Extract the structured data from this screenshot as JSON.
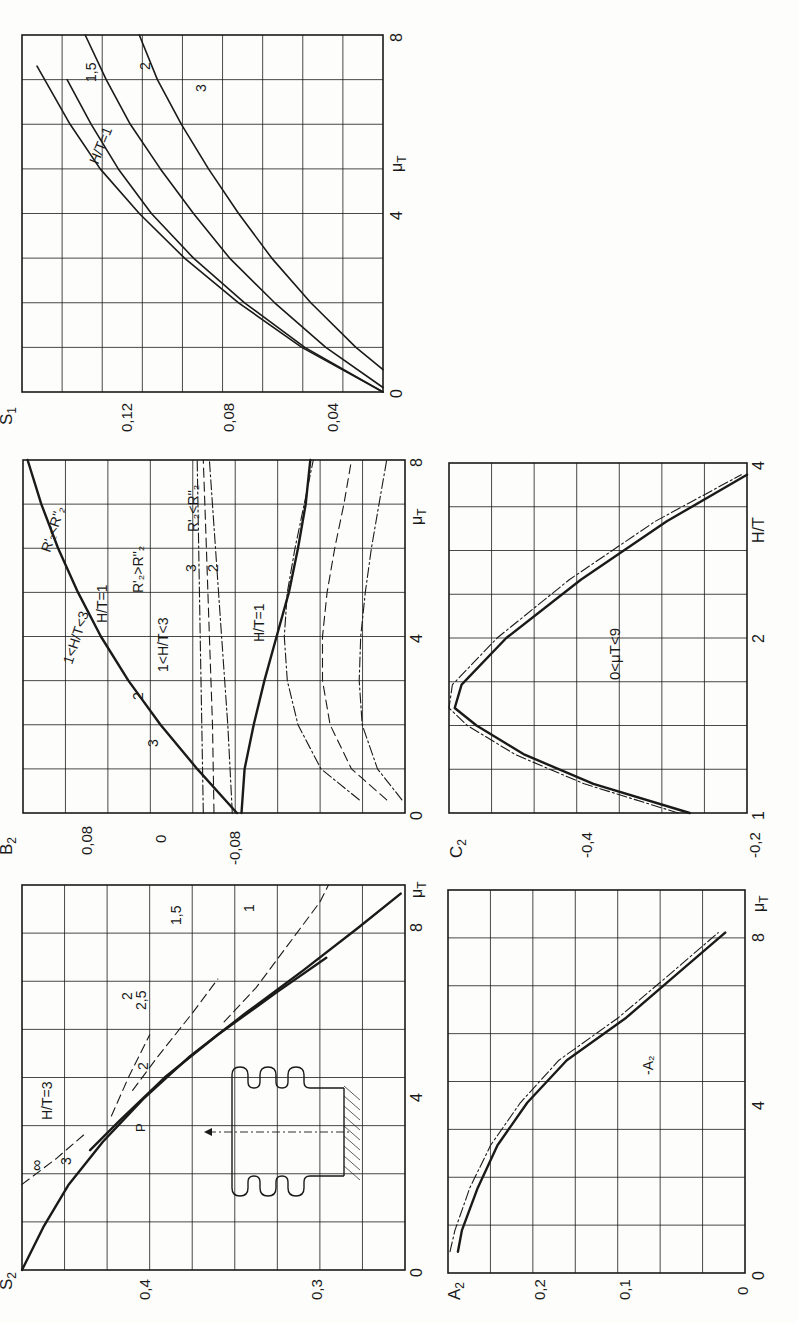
{
  "figure": {
    "orientation": "rotated 90° counter-clockwise",
    "background": "#fdfdfb",
    "ink": "#1a1a1a"
  },
  "chart_data": [
    {
      "id": "S1",
      "type": "line",
      "ylabel": "S1",
      "xlabel": "μT",
      "xlim": [
        0,
        8
      ],
      "ylim": [
        0.02,
        0.14
      ],
      "xticks": [
        "0",
        "4",
        "8"
      ],
      "yticks": [
        "0,04",
        "0,08",
        "0,12"
      ],
      "grid": true,
      "frame": {
        "left": 22,
        "top": 35,
        "right": 383,
        "bottom": 392
      },
      "series": [
        {
          "name": "H/T=1",
          "label": "H/T=1",
          "style": "solid",
          "x": [
            0,
            1,
            2,
            3,
            4,
            5,
            6,
            7.3
          ],
          "y": [
            0.02,
            0.047,
            0.068,
            0.086,
            0.101,
            0.114,
            0.124,
            0.135
          ]
        },
        {
          "name": "1,5",
          "label": "1,5",
          "style": "solid",
          "x": [
            0,
            1,
            2,
            3,
            4,
            5,
            6,
            7
          ],
          "y": [
            0.02,
            0.046,
            0.066,
            0.083,
            0.097,
            0.108,
            0.117,
            0.125
          ]
        },
        {
          "name": "2",
          "label": "2",
          "style": "solid",
          "x": [
            0.1,
            1,
            2,
            3,
            4,
            5,
            6,
            7,
            8
          ],
          "y": [
            0.02,
            0.039,
            0.056,
            0.071,
            0.083,
            0.094,
            0.104,
            0.112,
            0.119
          ]
        },
        {
          "name": "3",
          "label": "3",
          "style": "solid",
          "x": [
            0.5,
            1,
            2,
            3,
            4,
            5,
            6,
            7,
            8
          ],
          "y": [
            0.02,
            0.029,
            0.044,
            0.057,
            0.068,
            0.078,
            0.087,
            0.095,
            0.101
          ]
        }
      ]
    },
    {
      "id": "B2",
      "type": "line",
      "ylabel": "B2",
      "xlabel": "μT",
      "xlim": [
        0,
        8
      ],
      "ylim": [
        -0.11,
        0.14
      ],
      "xticks": [
        "0",
        "4",
        "8"
      ],
      "yticks": [
        "0,08",
        "0",
        "-0,08"
      ],
      "grid": true,
      "frame": {
        "left": 23,
        "top": 460,
        "right": 405,
        "bottom": 813
      },
      "annotations": [
        "R'2<R''2",
        "1<H/T<3",
        "H/T=1",
        "R'2>R''2",
        "2",
        "3",
        "1<H/T<3",
        "3",
        "2",
        "R'2<R''2",
        "H/T=1"
      ],
      "series": [
        {
          "name": "R'2<R''2 1<H/T<3 (upper)",
          "style": "solid-bold",
          "x": [
            0,
            1,
            2,
            3,
            4,
            5,
            6,
            7,
            8
          ],
          "y": [
            0,
            0.026,
            0.05,
            0.071,
            0.089,
            0.104,
            0.117,
            0.128,
            0.137
          ]
        },
        {
          "name": "H/T=1 R'2>R''2",
          "style": "dashdot",
          "x": [
            0,
            2,
            4,
            6,
            8
          ],
          "y": [
            0.022,
            0.023,
            0.024,
            0.025,
            0.026
          ]
        },
        {
          "name": "2 R'2>R''2",
          "style": "dashed",
          "x": [
            0,
            2,
            4,
            6,
            8
          ],
          "y": [
            0.015,
            0.016,
            0.018,
            0.02,
            0.022
          ]
        },
        {
          "name": "3 R'2>R''2",
          "style": "dashdot",
          "x": [
            0,
            2,
            4,
            6,
            8
          ],
          "y": [
            0.003,
            0.006,
            0.01,
            0.014,
            0.018
          ]
        },
        {
          "name": "1<H/T<3 R'2<R''2 (lower)",
          "style": "solid-bold",
          "x": [
            0,
            1,
            2,
            3,
            4,
            5,
            6,
            7,
            8
          ],
          "y": [
            -0.003,
            -0.005,
            -0.011,
            -0.018,
            -0.026,
            -0.034,
            -0.04,
            -0.045,
            -0.048
          ]
        },
        {
          "name": "3 R'2<R''2",
          "style": "dashdot",
          "x": [
            0.3,
            1,
            2,
            3,
            4,
            5,
            6,
            7,
            8
          ],
          "y": [
            -0.08,
            -0.055,
            -0.04,
            -0.033,
            -0.031,
            -0.033,
            -0.038,
            -0.044,
            -0.05
          ]
        },
        {
          "name": "2 R'2<R''2",
          "style": "dashed",
          "x": [
            0.3,
            1,
            2,
            3,
            4,
            5,
            6,
            7,
            8
          ],
          "y": [
            -0.098,
            -0.075,
            -0.061,
            -0.056,
            -0.056,
            -0.059,
            -0.064,
            -0.07,
            -0.075
          ]
        },
        {
          "name": "H/T=1 R'2<R''2",
          "style": "dashdot",
          "x": [
            0.3,
            1,
            2,
            3,
            4,
            5,
            6,
            7,
            8
          ],
          "y": [
            -0.108,
            -0.092,
            -0.082,
            -0.08,
            -0.081,
            -0.084,
            -0.088,
            -0.093,
            -0.098
          ]
        }
      ]
    },
    {
      "id": "C2",
      "type": "line",
      "ylabel": "C2",
      "xlabel": "H/T",
      "xlim": [
        1,
        4
      ],
      "ylim": [
        -0.46,
        -0.2
      ],
      "xticks": [
        "1",
        "2",
        "4"
      ],
      "yticks": [
        "-0,4",
        "-0,2"
      ],
      "grid": true,
      "frame": {
        "left": 449,
        "top": 463,
        "right": 747,
        "bottom": 813
      },
      "annotations": [
        "0<μT<9"
      ],
      "series": [
        {
          "name": "C2 solid",
          "style": "solid-bold",
          "x": [
            1,
            1.25,
            1.5,
            1.75,
            1.9,
            2.1,
            2.5,
            3,
            3.5,
            3.9
          ],
          "y": [
            -0.41,
            -0.326,
            -0.266,
            -0.224,
            -0.205,
            -0.211,
            -0.25,
            -0.315,
            -0.39,
            -0.46
          ]
        },
        {
          "name": "C2 dash-dot",
          "style": "dashdot",
          "x": [
            1,
            1.25,
            1.5,
            1.75,
            1.9,
            2.1,
            2.5,
            3,
            3.5,
            3.9
          ],
          "y": [
            -0.4,
            -0.318,
            -0.258,
            -0.216,
            -0.198,
            -0.203,
            -0.242,
            -0.305,
            -0.38,
            -0.455
          ]
        }
      ]
    },
    {
      "id": "S2",
      "type": "line",
      "ylabel": "S2",
      "xlabel": "μT",
      "xlim": [
        0,
        9
      ],
      "ylim": [
        0.27,
        0.45
      ],
      "xticks": [
        "0",
        "4",
        "8"
      ],
      "yticks": [
        "0,4",
        "0,3"
      ],
      "grid": true,
      "frame": {
        "left": 22,
        "top": 885,
        "right": 405,
        "bottom": 1270
      },
      "annotations": [
        "∞",
        "H/T=3",
        "3",
        "2,5",
        "2",
        "1,5",
        "1",
        "2",
        "P"
      ],
      "series": [
        {
          "name": "H/T=1",
          "style": "solid-bold",
          "x": [
            0,
            1,
            2,
            3,
            4,
            5,
            6,
            7,
            8,
            8.8
          ],
          "y": [
            0.45,
            0.44,
            0.428,
            0.412,
            0.393,
            0.371,
            0.345,
            0.318,
            0.292,
            0.272
          ]
        },
        {
          "name": "H/T=3",
          "style": "solid-bold",
          "x": [
            2.8,
            3.5,
            4.5,
            5.5,
            6.5,
            7.3
          ],
          "y": [
            0.418,
            0.404,
            0.383,
            0.358,
            0.33,
            0.307
          ]
        },
        {
          "name": "∞",
          "style": "dashed",
          "x": [
            2,
            2.6,
            3.2
          ],
          "y": [
            0.45,
            0.434,
            0.42
          ]
        },
        {
          "name": "2,5",
          "style": "dashed",
          "x": [
            3.6,
            4.5,
            5.5
          ],
          "y": [
            0.408,
            0.4,
            0.39
          ]
        },
        {
          "name": "2",
          "style": "dashed",
          "x": [
            4.2,
            5,
            6,
            6.8
          ],
          "y": [
            0.398,
            0.386,
            0.37,
            0.358
          ]
        },
        {
          "name": "1,5",
          "style": "dashed",
          "x": [
            5.8,
            6.6,
            7.6,
            8.6,
            9
          ],
          "y": [
            0.355,
            0.34,
            0.325,
            0.31,
            0.306
          ]
        }
      ]
    },
    {
      "id": "A2",
      "type": "line",
      "ylabel": "A2",
      "xlabel": "μT",
      "xlim": [
        0,
        9
      ],
      "ylim": [
        0,
        0.3
      ],
      "xticks": [
        "0",
        "4",
        "8"
      ],
      "yticks": [
        "0",
        "0,1",
        "0,2"
      ],
      "grid": true,
      "frame": {
        "left": 448,
        "top": 890,
        "right": 745,
        "bottom": 1273
      },
      "annotations": [
        "-A2"
      ],
      "series": [
        {
          "name": "A2",
          "style": "solid-bold",
          "x": [
            0.5,
            1,
            2,
            3,
            4,
            5,
            6,
            7,
            8
          ],
          "y": [
            0.29,
            0.286,
            0.27,
            0.25,
            0.22,
            0.18,
            0.12,
            0.07,
            0.02
          ]
        },
        {
          "name": "-A2",
          "style": "dashdot",
          "x": [
            0.5,
            1,
            2,
            3,
            4,
            5,
            6,
            7,
            8
          ],
          "y": [
            0.298,
            0.293,
            0.278,
            0.257,
            0.227,
            0.188,
            0.128,
            0.077,
            0.027
          ]
        }
      ]
    }
  ],
  "labels": {
    "S1": {
      "ylabel": "S",
      "ysub": "1",
      "xlabel": "μ",
      "xsub": "T",
      "y0": "0,04",
      "y1": "0,08",
      "y2": "0,12",
      "x0": "0",
      "x4": "4",
      "x8": "8",
      "c1": "H/T=1",
      "c15": "1,5",
      "c2": "2",
      "c3": "3"
    },
    "B2": {
      "ylabel": "B",
      "ysub": "2",
      "xlabel": "μ",
      "xsub": "T",
      "yp": "0,08",
      "y0": "0",
      "yn": "-0,08",
      "x0": "0",
      "x4": "4",
      "x8": "8",
      "r_lt": "R'₂<R''₂",
      "r_gt": "R'₂>R''₂",
      "r_lt2": "R'₂<R''₂",
      "ht_range": "1<H/T<3",
      "ht_range2": "1<H/T<3",
      "ht1": "H/T=1",
      "ht1b": "H/T=1",
      "n2": "2",
      "n3": "3",
      "n3b": "3",
      "n2b": "2"
    },
    "C2": {
      "ylabel": "C",
      "ysub": "2",
      "xlabel": "H/T",
      "y1": "-0,4",
      "y2": "-0,2",
      "x1": "1",
      "x2": "2",
      "x4": "4",
      "range": "0<μT<9"
    },
    "S2": {
      "ylabel": "S",
      "ysub": "2",
      "xlabel": "μ",
      "xsub": "T",
      "y4": "0,4",
      "y3": "0,3",
      "x0": "0",
      "x4": "4",
      "x8": "8",
      "inf": "∞",
      "ht3": "H/T=3",
      "n3": "3",
      "n25": "2,5",
      "n2": "2",
      "n15": "1,5",
      "n1": "1",
      "n2b": "2",
      "force": "P"
    },
    "A2": {
      "ylabel": "A",
      "ysub": "2",
      "xlabel": "μ",
      "xsub": "T",
      "y0": "0",
      "y1": "0,1",
      "y2": "0,2",
      "x0": "0",
      "x4": "4",
      "x8": "8",
      "neg": "-A₂"
    }
  }
}
